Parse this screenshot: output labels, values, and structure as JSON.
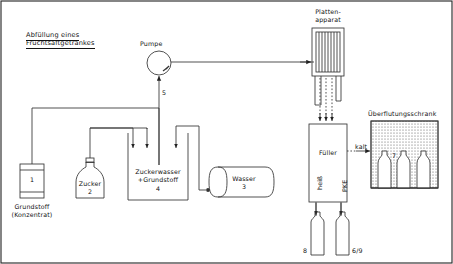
{
  "diagram": {
    "title_line1": "Abfüllung eines",
    "title_line2": "Fruchtsaftgetränkes",
    "frame_color": "#222222",
    "line_color": "#333333"
  },
  "equipment": {
    "pump": {
      "label": "Pumpe",
      "stream_number": "5"
    },
    "concentrate": {
      "number": "1",
      "caption_line1": "Grundstoff",
      "caption_line2": "(Konzentrat)"
    },
    "sugar": {
      "label": "Zucker",
      "number": "2"
    },
    "mix_tank": {
      "label_line1": "Zuckerwasser",
      "label_line2": "+Grundstoff",
      "number": "4"
    },
    "water_tank": {
      "label": "Wasser",
      "number": "3"
    },
    "plate_apparatus": {
      "label_line1": "Platten-",
      "label_line2": "apparat",
      "plate_count": 8
    },
    "filler": {
      "label": "Füller"
    },
    "flood_cabinet": {
      "label": "Überflutungsschrank",
      "number": "7",
      "bottle_count": 3
    }
  },
  "streams": {
    "hot": "heiß",
    "cold": "kalt",
    "pke": "PKE"
  },
  "bottles": {
    "hot_fill": "8",
    "pke_fill": "6/9"
  }
}
